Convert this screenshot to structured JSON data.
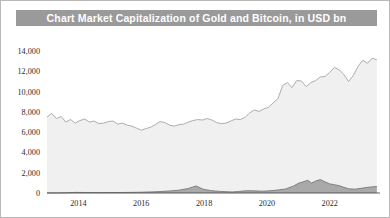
{
  "header": {
    "title": "Chart Market Capitalization of Gold and Bitcoin, in USD bn",
    "banner_color": "#9a9a9a",
    "text_color": "#ffffff"
  },
  "chart_data": {
    "type": "area",
    "title": "Chart Market Capitalization of Gold and Bitcoin, in USD bn",
    "subtitle": "",
    "xlabel": "",
    "ylabel": "",
    "unit": "USD bn",
    "grid": false,
    "legend_position": "none",
    "xlim": [
      2013.0,
      2023.6
    ],
    "ylim": [
      0,
      15000
    ],
    "yticks": [
      0,
      2000,
      4000,
      6000,
      8000,
      10000,
      12000,
      14000
    ],
    "ytick_labels": [
      "0",
      "2,000",
      "4,000",
      "6,000",
      "8,000",
      "10,000",
      "12,000",
      "14,000"
    ],
    "xticks": [
      2014,
      2016,
      2018,
      2020,
      2022
    ],
    "xtick_labels": [
      "2014",
      "2016",
      "2018",
      "2020",
      "2022"
    ],
    "series": [
      {
        "name": "Gold",
        "color": "#f0f0f0",
        "line_color": "#a0a0a0",
        "stacked": false,
        "x": [
          2013.0,
          2013.15,
          2013.3,
          2013.45,
          2013.6,
          2013.75,
          2013.9,
          2014.05,
          2014.2,
          2014.35,
          2014.5,
          2014.65,
          2014.8,
          2014.95,
          2015.1,
          2015.25,
          2015.4,
          2015.55,
          2015.7,
          2015.85,
          2016.0,
          2016.15,
          2016.3,
          2016.45,
          2016.6,
          2016.75,
          2016.9,
          2017.05,
          2017.2,
          2017.35,
          2017.5,
          2017.65,
          2017.8,
          2017.95,
          2018.1,
          2018.25,
          2018.4,
          2018.55,
          2018.7,
          2018.85,
          2019.0,
          2019.15,
          2019.3,
          2019.45,
          2019.6,
          2019.75,
          2019.9,
          2020.05,
          2020.2,
          2020.35,
          2020.5,
          2020.65,
          2020.8,
          2020.95,
          2021.1,
          2021.25,
          2021.4,
          2021.55,
          2021.7,
          2021.85,
          2022.0,
          2022.15,
          2022.3,
          2022.45,
          2022.6,
          2022.75,
          2022.9,
          2023.05,
          2023.2,
          2023.35,
          2023.5
        ],
        "values": [
          7500,
          7850,
          7350,
          7550,
          7000,
          7250,
          6900,
          7150,
          7300,
          7000,
          7100,
          6850,
          6900,
          7050,
          7100,
          6800,
          6900,
          6700,
          6600,
          6400,
          6200,
          6350,
          6500,
          6750,
          7050,
          6950,
          6700,
          6600,
          6750,
          6800,
          7000,
          7150,
          7250,
          7200,
          7350,
          7200,
          6950,
          6850,
          6900,
          7100,
          7300,
          7250,
          7450,
          7900,
          8200,
          8050,
          8300,
          8450,
          8900,
          9300,
          10600,
          10900,
          10400,
          11100,
          11050,
          10500,
          10900,
          11100,
          11450,
          11500,
          11900,
          12400,
          12150,
          11700,
          11000,
          11600,
          12500,
          13100,
          12800,
          13300,
          13150
        ]
      },
      {
        "name": "Bitcoin",
        "color": "#a9a9a9",
        "line_color": "#6f6f6f",
        "stacked": false,
        "x": [
          2013.0,
          2013.3,
          2013.6,
          2013.9,
          2014.2,
          2014.5,
          2014.8,
          2015.1,
          2015.4,
          2015.7,
          2016.0,
          2016.3,
          2016.6,
          2016.9,
          2017.2,
          2017.5,
          2017.75,
          2017.95,
          2018.05,
          2018.2,
          2018.35,
          2018.5,
          2018.7,
          2018.9,
          2019.1,
          2019.35,
          2019.6,
          2019.85,
          2020.1,
          2020.35,
          2020.6,
          2020.85,
          2021.0,
          2021.15,
          2021.3,
          2021.42,
          2021.55,
          2021.7,
          2021.85,
          2022.0,
          2022.15,
          2022.3,
          2022.45,
          2022.6,
          2022.8,
          2023.0,
          2023.2,
          2023.4,
          2023.5
        ],
        "values": [
          5,
          10,
          20,
          60,
          50,
          45,
          40,
          45,
          50,
          60,
          80,
          110,
          140,
          200,
          280,
          450,
          700,
          400,
          330,
          250,
          200,
          160,
          130,
          110,
          150,
          230,
          210,
          180,
          220,
          300,
          400,
          700,
          950,
          1100,
          1250,
          980,
          1180,
          1320,
          1100,
          900,
          820,
          720,
          560,
          420,
          380,
          460,
          560,
          620,
          640
        ]
      }
    ]
  }
}
